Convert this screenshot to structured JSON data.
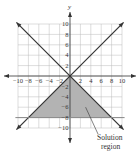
{
  "chart_data": {
    "type": "line",
    "title": "",
    "xlabel": "",
    "ylabel": "y",
    "xlim": [
      -10,
      10
    ],
    "ylim": [
      -10,
      10
    ],
    "grid": true,
    "x_ticks": [
      -10,
      -8,
      -6,
      -4,
      -2,
      2,
      4,
      6,
      8,
      10
    ],
    "y_ticks": [
      10,
      8,
      6,
      4,
      2,
      -2,
      -4,
      -6,
      -8,
      -10
    ],
    "x_tick_labels": [
      "−10",
      "−8",
      "−6",
      "−4",
      "−2",
      "2",
      "4",
      "6",
      "8",
      "10"
    ],
    "y_tick_labels": [
      "10",
      "8",
      "6",
      "4",
      "2",
      "−2",
      "−4",
      "−6",
      "−8",
      "−10"
    ],
    "series": [
      {
        "name": "y = x",
        "x": [
          -10,
          10
        ],
        "y": [
          -10,
          10
        ]
      },
      {
        "name": "y = -x",
        "x": [
          -10,
          10
        ],
        "y": [
          10,
          -10
        ]
      },
      {
        "name": "y = -8",
        "x": [
          -10,
          10
        ],
        "y": [
          -8,
          -8
        ]
      }
    ],
    "shaded_region": {
      "label": "Solution region",
      "vertices": [
        [
          0,
          0
        ],
        [
          -8,
          -8
        ],
        [
          8,
          -8
        ]
      ],
      "color": "#b3b3b3"
    },
    "annotations": [
      {
        "text_lines": [
          "Solution",
          "region"
        ],
        "points_to": [
          3,
          -6
        ]
      }
    ]
  },
  "colors": {
    "line": "#333333",
    "grid": "#bbbbbb",
    "shade": "#b3b3b3"
  }
}
